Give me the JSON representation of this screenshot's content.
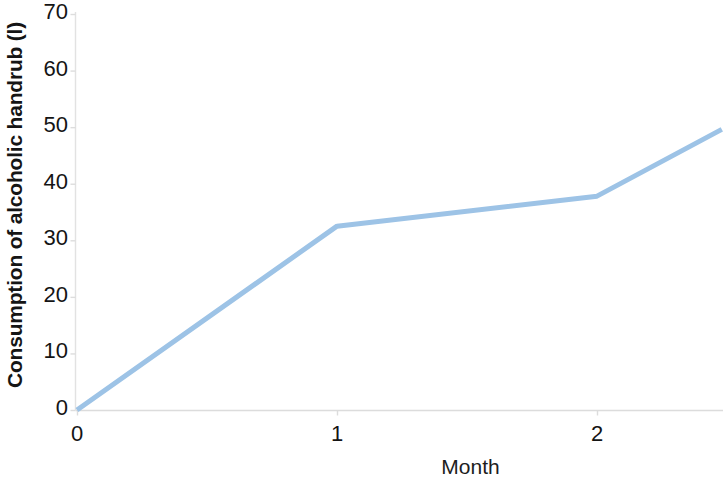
{
  "chart_data": {
    "type": "line",
    "title": "",
    "xlabel": "Month",
    "ylabel": "Consumption of alcoholic handrub (l)",
    "xlim": [
      0,
      2.48
    ],
    "ylim": [
      0,
      70
    ],
    "x_ticks": [
      "0",
      "1",
      "2"
    ],
    "x_tick_values": [
      0,
      1,
      2
    ],
    "y_ticks": [
      "0",
      "10",
      "20",
      "30",
      "40",
      "50",
      "60",
      "70"
    ],
    "y_tick_values": [
      0,
      10,
      20,
      30,
      40,
      50,
      60,
      70
    ],
    "grid": false,
    "legend": false,
    "series": [
      {
        "name": "Consumption of alcoholic handrub (l)",
        "color": "#9DC3E6",
        "line_width": 5,
        "markers": false,
        "x": [
          0,
          1,
          2,
          2.48
        ],
        "values": [
          0,
          32.5,
          37.8,
          49.6
        ]
      }
    ],
    "colors": {
      "line": "#9DC3E6",
      "axis": "#D9D9D9",
      "text": "#141414",
      "background": "#FFFFFF"
    }
  },
  "axes": {
    "y_title": "Consumption of alcoholic handrub (l)",
    "x_title": "Month"
  }
}
